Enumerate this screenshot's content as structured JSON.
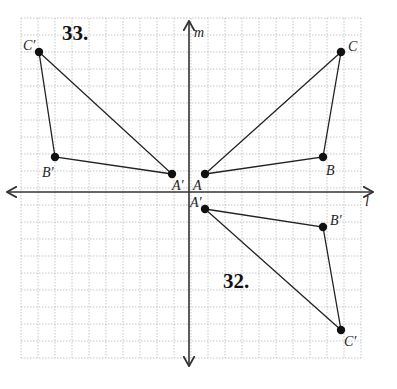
{
  "diagram": {
    "grid": {
      "x0": 21,
      "y0": 18,
      "cell": 17,
      "cols": 20,
      "rows": 20,
      "color": "#b8b8b8"
    },
    "axes": {
      "origin_px": [
        189,
        192
      ],
      "horizontal_label": "l",
      "vertical_label": "m",
      "color": "#333333"
    },
    "problems": [
      {
        "number": "33.",
        "number_pos": [
          62,
          40
        ]
      },
      {
        "number": "32.",
        "number_pos": [
          223,
          288
        ]
      }
    ],
    "triangles": [
      {
        "name": "original-ABC",
        "points": [
          {
            "label": "A",
            "px": [
              205,
              174
            ],
            "label_pos": [
              193,
              190
            ]
          },
          {
            "label": "B",
            "px": [
              323,
              157
            ],
            "label_pos": [
              326,
              175
            ]
          },
          {
            "label": "C",
            "px": [
              341,
              52
            ],
            "label_pos": [
              348,
              51
            ]
          }
        ]
      },
      {
        "name": "problem-33-image",
        "points": [
          {
            "label": "A′",
            "px": [
              172,
              174
            ],
            "label_pos": [
              172,
              190
            ]
          },
          {
            "label": "B′",
            "px": [
              55,
              157
            ],
            "label_pos": [
              42,
              177
            ]
          },
          {
            "label": "C′",
            "px": [
              39,
              52
            ],
            "label_pos": [
              23,
              50
            ]
          }
        ]
      },
      {
        "name": "problem-32-image",
        "points": [
          {
            "label": "A′",
            "px": [
              205,
              209
            ],
            "label_pos": [
              190,
              207
            ]
          },
          {
            "label": "B′",
            "px": [
              323,
              227
            ],
            "label_pos": [
              330,
              225
            ]
          },
          {
            "label": "C′",
            "px": [
              341,
              330
            ],
            "label_pos": [
              344,
              346
            ]
          }
        ]
      }
    ]
  }
}
